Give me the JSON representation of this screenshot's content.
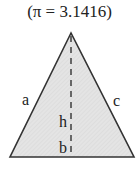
{
  "caption": "(π = 3.1416)",
  "triangle": {
    "labels": {
      "left_side": "a",
      "right_side": "c",
      "height": "h",
      "base": "b"
    },
    "fill_color": "#e2e2e2",
    "stroke_color": "#333333"
  }
}
